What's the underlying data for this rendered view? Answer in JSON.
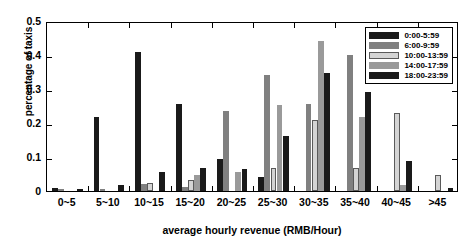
{
  "chart_data": {
    "type": "bar",
    "title": "",
    "xlabel": "average hourly revenue (RMB/Hour)",
    "ylabel": "percentage of taxis",
    "categories": [
      "0~5",
      "5~10",
      "10~15",
      "15~20",
      "20~25",
      "25~30",
      "30~35",
      "35~40",
      "40~45",
      ">45"
    ],
    "series": [
      {
        "name": "0:00-5:59",
        "color": "#1a1a1a",
        "values": [
          0.008,
          0.219,
          0.408,
          0.256,
          0.094,
          0.04,
          0.0,
          0.0,
          0.0,
          0.0
        ]
      },
      {
        "name": "6:00-9:59",
        "color": "#808080",
        "values": [
          0.004,
          0.005,
          0.02,
          0.012,
          0.236,
          0.341,
          0.255,
          0.4,
          0.0,
          0.0
        ]
      },
      {
        "name": "10:00-13:59",
        "color": "#d4d4d4",
        "values": [
          0.0,
          0.0,
          0.024,
          0.033,
          0.0,
          0.068,
          0.21,
          0.069,
          0.228,
          0.046
        ]
      },
      {
        "name": "14:00-17:59",
        "color": "#9a9a9a",
        "values": [
          0.0,
          0.0,
          0.0,
          0.046,
          0.057,
          0.253,
          0.441,
          0.219,
          0.017,
          0.0
        ]
      },
      {
        "name": "18:00-23:59",
        "color": "#1a1a1a",
        "values": [
          0.007,
          0.019,
          0.055,
          0.069,
          0.066,
          0.163,
          0.347,
          0.29,
          0.088,
          0.01
        ]
      }
    ],
    "ylim": [
      0,
      0.5
    ],
    "yticks": [
      "0",
      "0.1",
      "0.2",
      "0.3",
      "0.4",
      "0.5"
    ],
    "ytick_values": [
      0,
      0.1,
      0.2,
      0.3,
      0.4,
      0.5
    ],
    "grid": false,
    "legend_position": "top-right"
  }
}
